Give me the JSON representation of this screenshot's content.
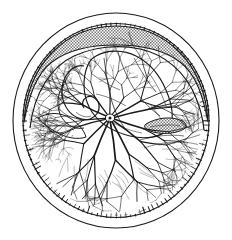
{
  "figure": {
    "caption": "",
    "type": "line-drawing",
    "background_color": "#ffffff",
    "ink_color": "#1a1a1a",
    "shade_color": "#9a9a9a",
    "canvas": {
      "width": 232,
      "height": 240
    }
  },
  "geometry": {
    "outer_circle": {
      "cx": 116,
      "cy": 120.5,
      "rx": 103,
      "ry": 107.5
    },
    "inner_circle": {
      "cx": 116,
      "cy": 120.5,
      "rx": 94,
      "ry": 98
    },
    "optic_disc": {
      "cx": 110,
      "cy": 118,
      "r": 5
    }
  },
  "parts": [
    {
      "id": "outer-rim",
      "label": "Outer scleral rim",
      "shape": "ellipse"
    },
    {
      "id": "ora-serrata",
      "label": "Ora serrata serrated band",
      "shape": "serrated-ring"
    },
    {
      "id": "choroid-band",
      "label": "Shaded choroid band",
      "shape": "crescent"
    },
    {
      "id": "optic-disc",
      "label": "Optic disc",
      "shape": "node"
    },
    {
      "id": "vessel-tree",
      "label": "Retinal vessel tree",
      "shape": "branching"
    },
    {
      "id": "macula-lobe",
      "label": "Upper lobed mass",
      "shape": "lobe"
    },
    {
      "id": "hook-fold",
      "label": "Left hook fold",
      "shape": "spiral"
    },
    {
      "id": "dark-oval",
      "label": "Right dark oval",
      "shape": "oval"
    }
  ],
  "colors": {
    "ink": "#1a1a1a",
    "shade": "#9a9a9a",
    "shade_light": "#bdbdbd",
    "paper": "#ffffff"
  },
  "counts": {
    "serration_ticks": 120,
    "major_vessels": 10
  }
}
